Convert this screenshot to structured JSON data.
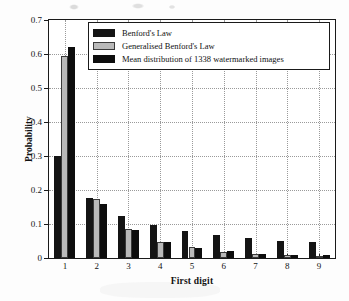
{
  "chart_data": {
    "type": "bar",
    "title": "",
    "xlabel": "First digit",
    "ylabel": "Probability",
    "categories": [
      "1",
      "2",
      "3",
      "4",
      "5",
      "6",
      "7",
      "8",
      "9"
    ],
    "ylim": [
      0,
      0.7
    ],
    "yticks": [
      0,
      0.1,
      0.2,
      0.3,
      0.4,
      0.5,
      0.6,
      0.7
    ],
    "ytick_labels": [
      "0",
      "0.1",
      "0.2",
      "0.3",
      "0.4",
      "0.5",
      "0.6",
      "0.7"
    ],
    "grid": "dotted both axes",
    "legend_position": "upper center inside axes",
    "series": [
      {
        "name": "Benford's Law",
        "color": "#141414",
        "values": [
          0.301,
          0.176,
          0.125,
          0.097,
          0.079,
          0.067,
          0.058,
          0.051,
          0.046
        ]
      },
      {
        "name": "Generalised Benford's Law",
        "color": "#b9b9b9",
        "values": [
          0.595,
          0.175,
          0.085,
          0.047,
          0.031,
          0.019,
          0.012,
          0.008,
          0.007
        ]
      },
      {
        "name": "Mean distribution of  1338 watermarked images",
        "color": "#0d0d0d",
        "values": [
          0.621,
          0.16,
          0.081,
          0.046,
          0.029,
          0.02,
          0.013,
          0.01,
          0.008
        ]
      }
    ]
  },
  "axes": {
    "x_axis_title": "First digit",
    "y_axis_title": "Probability"
  },
  "legend": {
    "entries": [
      {
        "label": "Benford's Law",
        "swatch": "black-swatch"
      },
      {
        "label": "Generalised Benford's Law",
        "swatch": "gray-swatch"
      },
      {
        "label": "Mean distribution of  1338 watermarked images",
        "swatch": "black-swatch"
      }
    ]
  }
}
